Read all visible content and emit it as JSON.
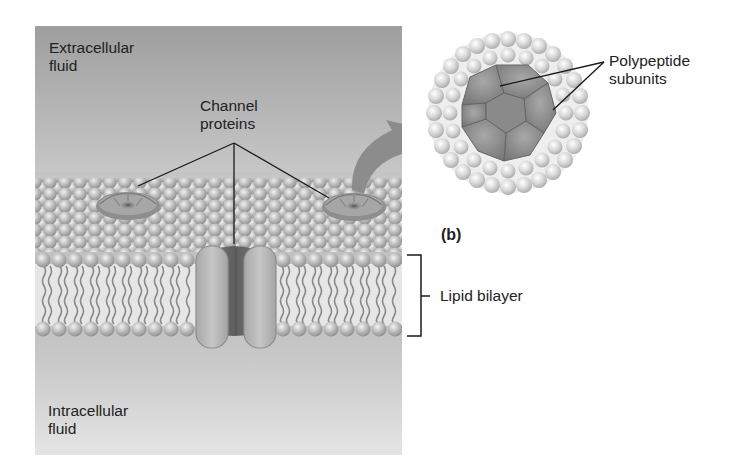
{
  "diagram": {
    "type": "channel-protein-membrane",
    "panel_label": "(b)",
    "regions": {
      "extracellular": {
        "line1": "Extracellular",
        "line2": "fluid"
      },
      "intracellular": {
        "line1": "Intracellular",
        "line2": "fluid"
      }
    },
    "callouts": {
      "channel_proteins": {
        "line1": "Channel",
        "line2": "proteins"
      },
      "polypeptide_subunits": {
        "line1": "Polypeptide",
        "line2": "subunits"
      },
      "lipid_bilayer": "Lipid bilayer"
    },
    "colors": {
      "background": "#ffffff",
      "fluid_top": "#9c9c9c",
      "fluid_bottom": "#e2e2e2",
      "lipid_head": "#b4b4b4",
      "protein_light": "#b8b8b8",
      "protein_dark": "#6e6e6e",
      "arrow": "#8a8a8a",
      "line": "#1a1a1a"
    }
  }
}
